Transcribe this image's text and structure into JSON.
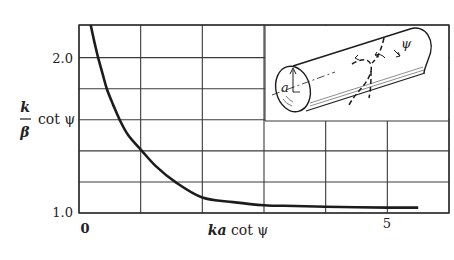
{
  "chart_data": {
    "type": "line",
    "title": "",
    "xlabel": "ka cot ψ",
    "ylabel": "(k/β) cot ψ",
    "ylabel_parts": {
      "numerator": "k",
      "denominator": "β",
      "suffix": "cot ψ"
    },
    "xlabel_parts": {
      "italic": "ka",
      "suffix": "cot ψ"
    },
    "xlim": [
      0,
      6
    ],
    "ylim": [
      1.0,
      2.21
    ],
    "x_tick_labels": [
      {
        "value": 0,
        "label": "0"
      },
      {
        "value": 5,
        "label": "5"
      }
    ],
    "y_tick_labels": [
      {
        "value": 1.0,
        "label": "1.0"
      },
      {
        "value": 2.0,
        "label": "2.0"
      }
    ],
    "x_gridlines": [
      0,
      1,
      2,
      3,
      4,
      5,
      6
    ],
    "y_gridlines": [
      1.0,
      1.2,
      1.4,
      1.6,
      1.8,
      2.0,
      2.21
    ],
    "grid": true,
    "legend": null,
    "series": [
      {
        "name": "(k/β) cot ψ vs ka cot ψ",
        "x": [
          0.19,
          0.25,
          0.31,
          0.38,
          0.45,
          0.55,
          0.66,
          0.8,
          1.02,
          1.25,
          1.56,
          2.0,
          2.5,
          3.0,
          3.5,
          4.0,
          4.5,
          5.0,
          5.5
        ],
        "y": [
          2.21,
          2.1,
          2.0,
          1.9,
          1.8,
          1.7,
          1.6,
          1.5,
          1.4,
          1.3,
          1.2,
          1.1,
          1.07,
          1.05,
          1.045,
          1.04,
          1.037,
          1.035,
          1.035
        ]
      }
    ],
    "inset": {
      "description": "Helix wound on a cylinder of radius a, showing pitch angle ψ",
      "labels": [
        "a",
        "ψ"
      ]
    }
  },
  "axes": {
    "y_top_label": "2.0",
    "y_bottom_label": "1.0",
    "x_left_label": "0",
    "x_right_label": "5",
    "xlabel_italic": "ka",
    "xlabel_rest": " cot ψ",
    "ylabel_num": "k",
    "ylabel_den": "β",
    "ylabel_rest": "cot ψ"
  },
  "inset": {
    "radius_label": "a",
    "angle_label": "ψ"
  },
  "colors": {
    "ink": "#1c1c1c",
    "grid": "#3a3a3a",
    "background": "#ffffff"
  }
}
